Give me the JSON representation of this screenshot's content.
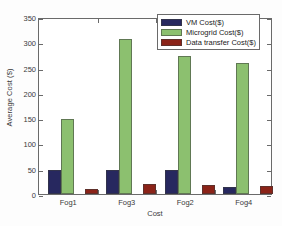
{
  "chart_data": {
    "type": "bar",
    "title": "",
    "xlabel": "Cost",
    "ylabel": "Average Cost ($)",
    "categories": [
      "Fog1",
      "Fog3",
      "Fog2",
      "Fog4"
    ],
    "ylim": [
      0,
      350
    ],
    "yticks": [
      0,
      50,
      100,
      150,
      200,
      250,
      300,
      350
    ],
    "grid": false,
    "legend_position": "upper right",
    "series": [
      {
        "name": "VM Cost($)",
        "color": "#27285f",
        "values": [
          48,
          48,
          48,
          13
        ]
      },
      {
        "name": "Microgrid Cost($)",
        "color": "#8cc06f",
        "values": [
          148,
          306,
          273,
          259
        ]
      },
      {
        "name": "Data transfer Cost($)",
        "color": "#8b2318",
        "values": [
          10,
          19,
          17,
          16
        ]
      }
    ]
  },
  "axes": {
    "frame_color": "#6a6a6a",
    "background": "#ffffff"
  }
}
